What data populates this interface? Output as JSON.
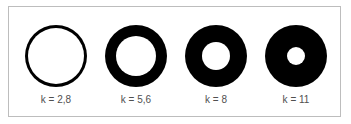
{
  "figure": {
    "ring_color": "#000000",
    "frame_border_color": "#bdbdbd",
    "label_color": "#505050",
    "items": [
      {
        "label": "k = 2,8",
        "k": 2.8,
        "center_x": 56,
        "outer_diameter": 62,
        "inner_diameter": 56
      },
      {
        "label": "k = 5,6",
        "k": 5.6,
        "center_x": 136,
        "outer_diameter": 62,
        "inner_diameter": 40
      },
      {
        "label": "k = 8",
        "k": 8,
        "center_x": 216,
        "outer_diameter": 62,
        "inner_diameter": 28
      },
      {
        "label": "k = 11",
        "k": 11,
        "center_x": 296,
        "outer_diameter": 62,
        "inner_diameter": 18
      }
    ]
  }
}
